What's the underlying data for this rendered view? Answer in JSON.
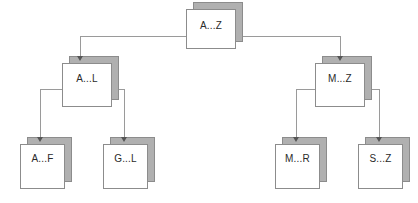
{
  "diagram": {
    "type": "tree",
    "title": "",
    "nodes": [
      {
        "id": "root",
        "label": "A...Z",
        "level": 0,
        "x": 186,
        "y": 9,
        "w": 50,
        "h": 40
      },
      {
        "id": "al",
        "label": "A...L",
        "level": 1,
        "x": 62,
        "y": 63,
        "w": 50,
        "h": 44
      },
      {
        "id": "mz",
        "label": "M...Z",
        "level": 1,
        "x": 315,
        "y": 63,
        "w": 50,
        "h": 44
      },
      {
        "id": "af",
        "label": "A...F",
        "level": 2,
        "x": 20,
        "y": 144,
        "w": 45,
        "h": 45
      },
      {
        "id": "gl",
        "label": "G...L",
        "level": 2,
        "x": 103,
        "y": 144,
        "w": 45,
        "h": 45
      },
      {
        "id": "mr",
        "label": "M...R",
        "level": 2,
        "x": 275,
        "y": 144,
        "w": 45,
        "h": 45
      },
      {
        "id": "sz",
        "label": "S...Z",
        "level": 2,
        "x": 358,
        "y": 144,
        "w": 45,
        "h": 45
      }
    ],
    "edges": [
      {
        "from": "root",
        "to": "al"
      },
      {
        "from": "root",
        "to": "mz"
      },
      {
        "from": "al",
        "to": "af"
      },
      {
        "from": "al",
        "to": "gl"
      },
      {
        "from": "mz",
        "to": "mr"
      },
      {
        "from": "mz",
        "to": "sz"
      }
    ],
    "colors": {
      "box_fill": "#ffffff",
      "box_border": "#8c8c8c",
      "box_bevel": "#b0b0b0",
      "connector": "#9a9a9a",
      "arrowhead": "#555555",
      "label_text": "#2a2a2a",
      "background": "#ffffff"
    }
  }
}
